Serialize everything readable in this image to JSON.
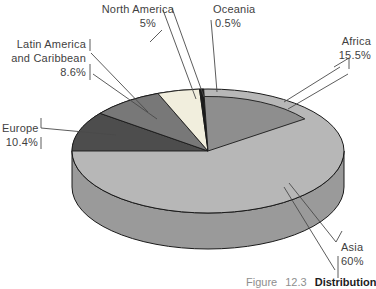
{
  "chart_data": {
    "type": "pie",
    "style": "3d-grayscale",
    "unit": "%",
    "slices": [
      {
        "label": "Europe",
        "value": 10.4,
        "color": "#4d4d4d"
      },
      {
        "label": "Latin America and Caribbean",
        "value": 8.6,
        "color": "#787878"
      },
      {
        "label": "North America",
        "value": 5,
        "color": "#f1eedd"
      },
      {
        "label": "Oceania",
        "value": 0.5,
        "color": "#1c1c1c"
      },
      {
        "label": "Africa",
        "value": 15.5,
        "color": "#8e8e8e",
        "inset": 0.88
      },
      {
        "label": "Asia",
        "value": 60,
        "color": "#b7b7b7",
        "base": true
      }
    ],
    "wall_color": "#9a9a9a",
    "outline_color": "#1a1a1a",
    "legend_position": "callout-labels",
    "title": ""
  },
  "labels": {
    "north_america": {
      "line1": "North America",
      "value": "5%"
    },
    "oceania": {
      "line1": "Oceania",
      "value": "0.5%"
    },
    "africa": {
      "line1": "Africa",
      "value": "15.5%"
    },
    "latin_america": {
      "line1": "Latin America",
      "line2": "and Caribbean",
      "value": "8.6%"
    },
    "europe": {
      "line1": "Europe",
      "value": "10.4%"
    },
    "asia": {
      "line1": "Asia",
      "value": "60%"
    }
  },
  "caption": {
    "figure_word": "Figure",
    "figure_number": "12.3",
    "title": "Distribution"
  }
}
